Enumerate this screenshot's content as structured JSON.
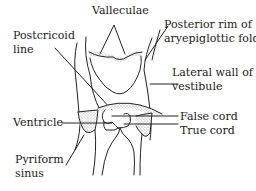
{
  "diagram": {
    "type": "anatomical line drawing",
    "labels": {
      "valleculae": "Valleculae",
      "postcricoid_line_1": "Postcricoid",
      "postcricoid_line_2": "line",
      "posterior_rim_1": "Posterior rim of",
      "posterior_rim_2": "aryepiglottic fold",
      "lateral_wall_1": "Lateral wall of",
      "lateral_wall_2": "vestibule",
      "ventricle": "Ventricle",
      "false_cord": "False cord",
      "true_cord": "True cord",
      "pyriform_1": "Pyriform",
      "pyriform_2": "sinus"
    },
    "colors": {
      "line": "#222222",
      "stipple": "#9a9a9a",
      "background": "#ffffff"
    }
  }
}
